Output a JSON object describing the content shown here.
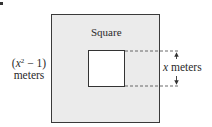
{
  "diagram": {
    "type": "geometry-figure",
    "outer_square": {
      "label": "Square",
      "side_label_var": "x",
      "side_label_exp": "2",
      "side_label_rest": " − 1)",
      "side_label_open": "(",
      "side_label_unit": "meters",
      "fill_color": "#ebebeb",
      "stroke_color": "#3a3a3a"
    },
    "inner_square": {
      "side_label_var": "x",
      "side_label_unit": " meters",
      "fill_color": "#ffffff",
      "stroke_color": "#333333"
    },
    "dimension_marker": {
      "style": "dashed extension lines with double-headed arrow",
      "measures": "inner square side"
    }
  }
}
